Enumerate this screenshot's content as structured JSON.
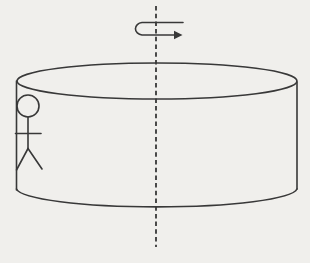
{
  "diagram": {
    "name": "rotating-cylinder-with-person",
    "colors": {
      "background": "#f0efec",
      "line": "#383838"
    },
    "axis": {
      "x": 156,
      "y1": 6,
      "y2": 247,
      "dash": "4.5 3.2"
    },
    "rotation_arrow": {
      "path": "M 183 22.5 L 142 22.5 A 7.5 6.3 0 0 0 142 35 L 174 35",
      "head_points": "174,30.8 182.5,35 174,39.2"
    },
    "cylinder": {
      "top_ellipse": {
        "cx": 157,
        "cy": 81,
        "rx": 140,
        "ry": 18
      },
      "left_wall": {
        "x1": 16.5,
        "y1": 81,
        "x2": 16.5,
        "y2": 190
      },
      "right_wall": {
        "x1": 297,
        "y1": 82,
        "x2": 297,
        "y2": 189
      },
      "bottom_arc_path": "M 16.5 189 A 140.5 19 0 0 0 297 189"
    },
    "person": {
      "head": {
        "cx": 28,
        "cy": 106,
        "r": 11
      },
      "body": {
        "x1": 28,
        "y1": 117,
        "x2": 28,
        "y2": 148.5
      },
      "arms": {
        "x1": 15.5,
        "y1": 133.5,
        "x2": 41,
        "y2": 133.5
      },
      "left_leg": {
        "x1": 28,
        "y1": 148.5,
        "x2": 16.5,
        "y2": 170
      },
      "right_leg": {
        "x1": 28,
        "y1": 148.5,
        "x2": 42,
        "y2": 169
      }
    }
  }
}
